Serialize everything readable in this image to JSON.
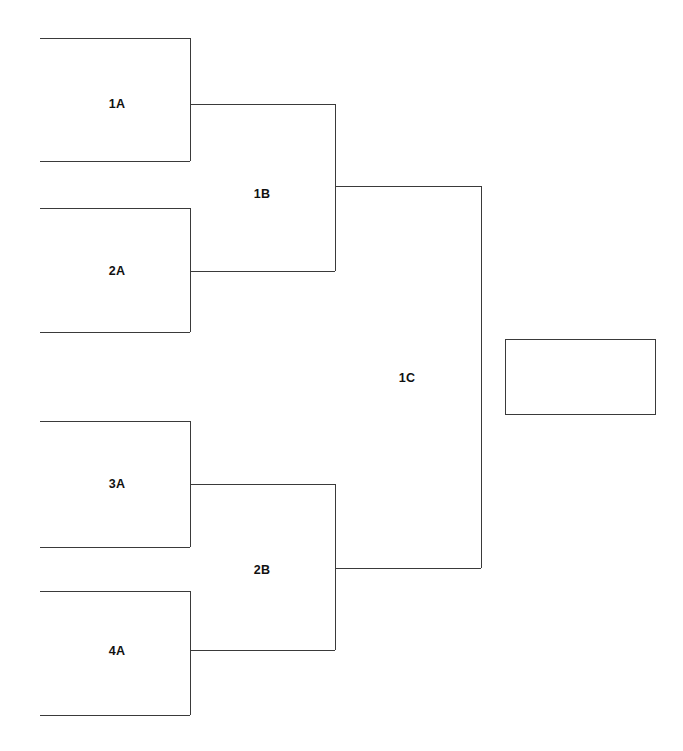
{
  "diagram": {
    "type": "single-elimination-tournament-bracket",
    "title": "",
    "background_color": "#ffffff",
    "line_color": "#3a3a3a",
    "text_color": "#111111",
    "canvas": {
      "width": 683,
      "height": 751
    }
  },
  "rounds": [
    {
      "name": "round-1",
      "slots": [
        {
          "id": "1A",
          "label": "1A",
          "x_left": 40,
          "x_right": 190,
          "y_top": 38,
          "y_bottom": 161,
          "y_connector": 104,
          "label_x": 117,
          "label_y": 104
        },
        {
          "id": "2A",
          "label": "2A",
          "x_left": 40,
          "x_right": 190,
          "y_top": 208,
          "y_bottom": 332,
          "y_connector": 271,
          "label_x": 117,
          "label_y": 271
        },
        {
          "id": "3A",
          "label": "3A",
          "x_left": 40,
          "x_right": 190,
          "y_top": 421,
          "y_bottom": 547,
          "y_connector": 484,
          "label_x": 117,
          "label_y": 484
        },
        {
          "id": "4A",
          "label": "4A",
          "x_left": 40,
          "x_right": 190,
          "y_top": 591,
          "y_bottom": 715,
          "y_connector": 651,
          "label_x": 117,
          "label_y": 651
        }
      ]
    },
    {
      "name": "round-2",
      "slots": [
        {
          "id": "1B",
          "label": "1B",
          "x_left": 190,
          "x_right": 335,
          "y_top": 104,
          "y_bottom": 271,
          "y_connector": 186,
          "label_x": 262,
          "label_y": 194
        },
        {
          "id": "2B",
          "label": "2B",
          "x_left": 190,
          "x_right": 335,
          "y_top": 484,
          "y_bottom": 650,
          "y_connector": 568,
          "label_x": 262,
          "label_y": 570
        }
      ]
    },
    {
      "name": "round-3",
      "slots": [
        {
          "id": "1C",
          "label": "1C",
          "x_left": 335,
          "x_right": 481,
          "y_top": 186,
          "y_bottom": 568,
          "y_connector": 378,
          "label_x": 407,
          "label_y": 378
        }
      ]
    },
    {
      "name": "final",
      "slots": [
        {
          "id": "champion",
          "label": "",
          "x_left": 505,
          "x_right": 656,
          "y_top": 339,
          "y_bottom": 415
        }
      ]
    }
  ],
  "labels": {
    "r1_slot1": "1A",
    "r1_slot2": "2A",
    "r1_slot3": "3A",
    "r1_slot4": "4A",
    "r2_slot1": "1B",
    "r2_slot2": "2B",
    "r3_slot1": "1C",
    "champion": ""
  }
}
